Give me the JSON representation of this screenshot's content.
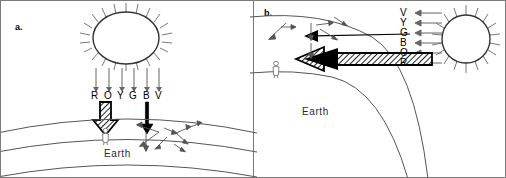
{
  "figure": {
    "width": 506,
    "height": 178,
    "background": "#ffffff",
    "border_color": "#7a7a7a",
    "ink_color": "#000000",
    "line_color": "#555555"
  },
  "panels": [
    {
      "id": "a",
      "label": "a.",
      "caption_text": "Earth",
      "sun": {
        "name": "sun",
        "position": "top-center",
        "shape": "ellipse-with-rays",
        "ray_count": 20
      },
      "incoming_rays": {
        "count": 6,
        "direction": "downward"
      },
      "spectrum_letters": [
        "R",
        "O",
        "Y",
        "G",
        "B",
        "V"
      ],
      "transmitted_arrow": {
        "name": "direct-sunlight-arrow",
        "style": "thick-hatched",
        "direction": "down",
        "under_letters": [
          "R",
          "O"
        ]
      },
      "scattered_beam_arrow": {
        "name": "blue-light-arrow",
        "style": "solid-thin-block",
        "direction": "down",
        "under_letters": [
          "B"
        ]
      },
      "scatter_arrow_count": 9,
      "observer": {
        "name": "observer-person",
        "on_surface": true
      }
    },
    {
      "id": "b",
      "label": "b.",
      "caption_text": "Earth",
      "sun": {
        "name": "sun",
        "position": "right-horizon",
        "shape": "circle-with-rays",
        "ray_count": 20
      },
      "incoming_rays": {
        "count": 6,
        "direction": "leftward"
      },
      "spectrum_letters": [
        "V",
        "Y",
        "G",
        "B",
        "O",
        "R"
      ],
      "transmitted_arrow": {
        "name": "direct-sunlight-arrow",
        "style": "thick-hatched",
        "direction": "left"
      },
      "scattered_beam_arrow": {
        "name": "blue-light-arrow",
        "style": "solid-thin-block",
        "direction": "left"
      },
      "scatter_arrow_count": 7,
      "observer": {
        "name": "observer-person",
        "on_surface": true
      }
    }
  ]
}
